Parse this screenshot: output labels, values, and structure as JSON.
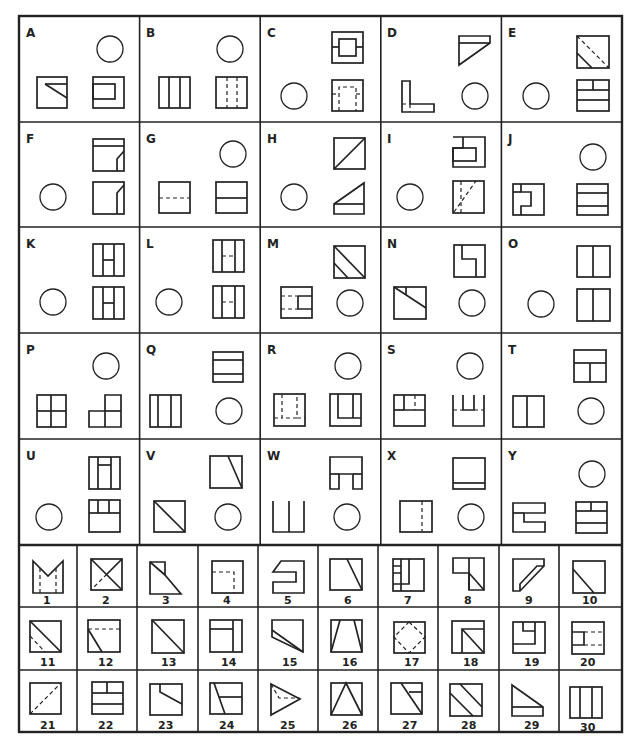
{
  "problems": [
    {
      "label": "A",
      "views": [
        "square with short diagonal from top-center to right",
        "square with inner rectangle",
        "circle (missing view)"
      ]
    },
    {
      "label": "B",
      "views": [
        "circle (missing view)",
        "square with 2 vertical lines",
        "square with 2 dashed vertical lines"
      ]
    },
    {
      "label": "C",
      "views": [
        "square with inner square and side ticks",
        "circle (missing view)",
        "square with dashed inner U"
      ]
    },
    {
      "label": "D",
      "views": [
        "triangle with top band",
        "L-shape with dashed line",
        "circle (missing view)"
      ]
    },
    {
      "label": "E",
      "views": [
        "square with diagonal and dashed diagonal",
        "circle (missing view)",
        "square with horizontal bands and T"
      ]
    },
    {
      "label": "F",
      "views": [
        "square with top band and bevel",
        "circle (missing view)",
        "square with bevel corner"
      ]
    },
    {
      "label": "G",
      "views": [
        "circle (missing view)",
        "square with dashed horizontal",
        "square with horizontal line"
      ]
    },
    {
      "label": "H",
      "views": [
        "square with diagonal",
        "circle (missing view)",
        "triangle with base band"
      ]
    },
    {
      "label": "I",
      "views": [
        "stepped square",
        "circle (missing view)",
        "square with dashed diagonal"
      ]
    },
    {
      "label": "J",
      "views": [
        "circle (missing view)",
        "square with notched inner H",
        "square with two horizontal lines"
      ]
    },
    {
      "label": "K",
      "views": [
        "square with H pattern",
        "circle (missing view)",
        "square with H pattern"
      ]
    },
    {
      "label": "L",
      "views": [
        "square with dashed H",
        "circle (missing view)",
        "square with dashed H"
      ]
    },
    {
      "label": "M",
      "views": [
        "square with diagonal and partial diagonal",
        "square with dashed bracket",
        "circle (missing view)"
      ]
    },
    {
      "label": "N",
      "views": [
        "square with step",
        "square with diagonal and tick",
        "circle (missing view)"
      ]
    },
    {
      "label": "O",
      "views": [
        "square with vertical center line",
        "circle (missing view)",
        "square with vertical center line"
      ]
    },
    {
      "label": "P",
      "views": [
        "circle (missing view)",
        "square divided in four",
        "L-shaped step"
      ]
    },
    {
      "label": "Q",
      "views": [
        "square with two horizontal lines",
        "square with two vertical lines",
        "circle (missing view)"
      ]
    },
    {
      "label": "R",
      "views": [
        "circle (missing view)",
        "square with dashed U",
        "square with solid U"
      ]
    },
    {
      "label": "S",
      "views": [
        "circle (missing view)",
        "square with top notch",
        "U-shape with dashed line"
      ]
    },
    {
      "label": "T",
      "views": [
        "square with T pattern",
        "square with vertical line",
        "circle (missing view)"
      ]
    },
    {
      "label": "U",
      "views": [
        "square with H and cross bar",
        "circle (missing view)",
        "square with top cells"
      ]
    },
    {
      "label": "V",
      "views": [
        "square with slanted line",
        "square with diagonal",
        "circle (missing view)"
      ]
    },
    {
      "label": "W",
      "views": [
        "T-shape",
        "open-top U with center line",
        "circle (missing view)"
      ]
    },
    {
      "label": "X",
      "views": [
        "square with bottom line",
        "square with dashed vertical",
        "circle (missing view)"
      ]
    },
    {
      "label": "Y",
      "views": [
        "circle (missing view)",
        "C/E-shape",
        "square with horizontal bands and T"
      ]
    }
  ],
  "answers": [
    {
      "n": "1"
    },
    {
      "n": "2"
    },
    {
      "n": "3"
    },
    {
      "n": "4"
    },
    {
      "n": "5"
    },
    {
      "n": "6"
    },
    {
      "n": "7"
    },
    {
      "n": "8"
    },
    {
      "n": "9"
    },
    {
      "n": "10"
    },
    {
      "n": "11"
    },
    {
      "n": "12"
    },
    {
      "n": "13"
    },
    {
      "n": "14"
    },
    {
      "n": "15"
    },
    {
      "n": "16"
    },
    {
      "n": "17"
    },
    {
      "n": "18"
    },
    {
      "n": "19"
    },
    {
      "n": "20"
    },
    {
      "n": "21"
    },
    {
      "n": "22"
    },
    {
      "n": "23"
    },
    {
      "n": "24"
    },
    {
      "n": "25"
    },
    {
      "n": "26"
    },
    {
      "n": "27"
    },
    {
      "n": "28"
    },
    {
      "n": "29"
    },
    {
      "n": "30"
    }
  ],
  "colors": {
    "ink": "#222222",
    "paper": "#ffffff"
  }
}
